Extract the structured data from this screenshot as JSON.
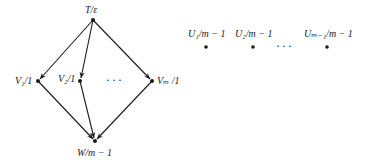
{
  "diagram": {
    "left_graph": {
      "nodes": [
        {
          "id": "T",
          "label": "T/ε",
          "x": 93,
          "y": 20
        },
        {
          "id": "V1",
          "label": "V₁/1",
          "x": 38,
          "y": 81
        },
        {
          "id": "V2",
          "label": "V₂/1",
          "x": 80,
          "y": 81
        },
        {
          "id": "Vm",
          "label": "Vₘ /1",
          "x": 152,
          "y": 81
        },
        {
          "id": "W",
          "label": "W/m − 1",
          "x": 95,
          "y": 141
        }
      ],
      "edges": [
        {
          "from": "T",
          "to": "V1"
        },
        {
          "from": "T",
          "to": "V2"
        },
        {
          "from": "T",
          "to": "Vm"
        },
        {
          "from": "V1",
          "to": "W"
        },
        {
          "from": "V2",
          "to": "W"
        },
        {
          "from": "Vm",
          "to": "W"
        }
      ],
      "ellipsis": "···"
    },
    "right_nodes": {
      "nodes": [
        {
          "id": "U1",
          "label": "U₁/m − 1",
          "x": 206,
          "y": 46
        },
        {
          "id": "U2",
          "label": "U₂/m − 1",
          "x": 253,
          "y": 46
        },
        {
          "id": "Um-1",
          "label": "Uₘ₋₁/m − 1",
          "x": 327,
          "y": 46
        }
      ],
      "ellipsis": "···"
    }
  },
  "labels": {
    "T": "T/ε",
    "V1": "V₁/1",
    "V2": "V₂/1",
    "Vm": "Vₘ /1",
    "W": "W/m − 1",
    "U1": "U₁/m − 1",
    "U2": "U₂/m − 1",
    "Um1": "Uₘ₋₁/m − 1",
    "ellipsis_left": "···",
    "ellipsis_right": "···"
  }
}
